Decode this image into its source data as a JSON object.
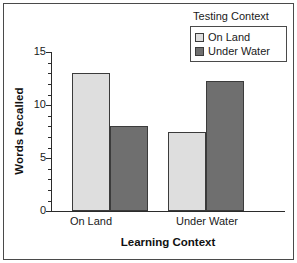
{
  "chart_data": {
    "type": "bar",
    "title": "",
    "xlabel": "Learning Context",
    "ylabel": "Words Recalled",
    "categories": [
      "On Land",
      "Under Water"
    ],
    "series": [
      {
        "name": "On Land",
        "values": [
          13.0,
          7.5
        ],
        "color": "#dedede"
      },
      {
        "name": "Under Water",
        "values": [
          8.0,
          12.3
        ],
        "color": "#6f6f6f"
      }
    ],
    "ylim": [
      0,
      15
    ],
    "ytick_labels": [
      "0",
      "5",
      "10",
      "15"
    ],
    "ytick_values": [
      0,
      5,
      10,
      15
    ],
    "yminor_step": 1,
    "grid": false,
    "legend_position": "top-right"
  },
  "axes": {
    "y_title": "Words Recalled",
    "x_title": "Learning Context",
    "y_ticks": [
      {
        "label": "15",
        "value": 15
      },
      {
        "label": "10",
        "value": 10
      },
      {
        "label": "5",
        "value": 5
      },
      {
        "label": "0",
        "value": 0
      }
    ],
    "x_ticks": [
      {
        "label": "On Land"
      },
      {
        "label": "Under Water"
      }
    ]
  },
  "legend": {
    "title": "Testing Context",
    "items": [
      {
        "label": "On Land",
        "color": "#dedede"
      },
      {
        "label": "Under Water",
        "color": "#6f6f6f"
      }
    ]
  },
  "bars": [
    {
      "group": "On Land",
      "series": "On Land",
      "value": 13.0
    },
    {
      "group": "On Land",
      "series": "Under Water",
      "value": 8.0
    },
    {
      "group": "Under Water",
      "series": "On Land",
      "value": 7.5
    },
    {
      "group": "Under Water",
      "series": "Under Water",
      "value": 12.3
    }
  ],
  "colors": {
    "light_bar": "#dedede",
    "dark_bar": "#6f6f6f",
    "axis": "#2b2b2b",
    "border": "#4a4a4a",
    "background": "#ffffff"
  }
}
